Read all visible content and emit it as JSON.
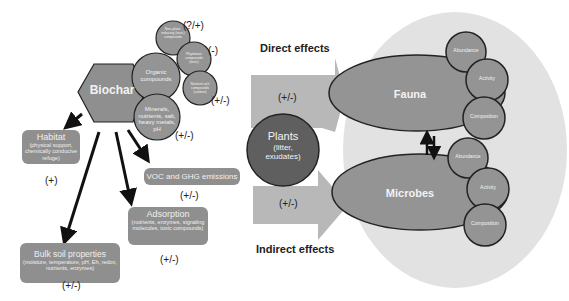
{
  "diagram": {
    "biochar": {
      "label": "Biochar",
      "components": [
        {
          "label": "Organic compounds",
          "sign": ""
        },
        {
          "label": "Minerals, nutrients, salt, heavy metals, pH",
          "sign": "(+/-)"
        }
      ],
      "organic_subcomponents": [
        {
          "label": "Non-plant-inducing (toxic) compounds",
          "sign": "(?/+)"
        },
        {
          "label": "Phytotoxic compounds (toxic)",
          "sign": "(-)"
        },
        {
          "label": "Nutrient-rich compounds (carbon)",
          "sign": "(+/-)"
        }
      ]
    },
    "effects": [
      {
        "title": "Habitat",
        "detail": "(physical support, chemically conducive refuge)",
        "sign": "(+)"
      },
      {
        "title": "VOC and GHG emissions",
        "detail": "",
        "sign": "(+/-)"
      },
      {
        "title": "Adsorption",
        "detail": "(nutrients, enzymes, signaling molecules, toxic compounds)",
        "sign": "(+/-)"
      },
      {
        "title": "Bulk soil properties",
        "detail": "(moisture, temperature, pH, Eh, redox, nutrients, enzymes)",
        "sign": "(+/-)"
      }
    ],
    "direct_effects": {
      "label": "Direct effects",
      "sign": "(+/-)"
    },
    "indirect_effects": {
      "label": "Indirect effects",
      "sign": "(+/-)"
    },
    "plants": {
      "label": "Plants",
      "detail": "(litter, exudates)"
    },
    "soil_biota": {
      "fauna": {
        "label": "Fauna",
        "attributes": [
          "Abundance",
          "Activity",
          "Composition"
        ]
      },
      "microbes": {
        "label": "Microbes",
        "attributes": [
          "Abundance",
          "Activity",
          "Composition"
        ]
      }
    },
    "colors": {
      "node_fill": "#8f8f8f",
      "plants_fill": "#5f5f5f",
      "arrow_fill": "#b8b8b8",
      "biota_background": "#e0e0e0",
      "outline": "#222222"
    }
  }
}
